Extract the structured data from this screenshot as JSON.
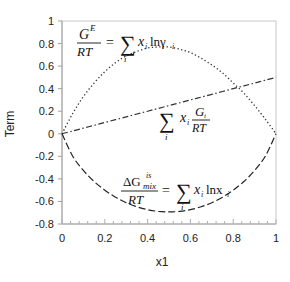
{
  "chart_data": {
    "type": "line",
    "title": "",
    "xlabel": "x1",
    "ylabel": "Term",
    "xlim": [
      0,
      1
    ],
    "ylim": [
      -0.8,
      1
    ],
    "x_ticks": [
      "0",
      "0.2",
      "0.4",
      "0.6",
      "0.8",
      "1"
    ],
    "y_ticks": [
      "1",
      "0.8",
      "0.6",
      "0.4",
      "0.2",
      "0",
      "-0.2",
      "-0.4",
      "-0.6",
      "-0.8"
    ],
    "grid": false,
    "legend": "none (inline equation annotations)",
    "x": [
      0,
      0.05,
      0.1,
      0.15,
      0.2,
      0.25,
      0.3,
      0.35,
      0.4,
      0.45,
      0.5,
      0.55,
      0.6,
      0.65,
      0.7,
      0.75,
      0.8,
      0.85,
      0.9,
      0.95,
      1
    ],
    "series": [
      {
        "name": "G^E/RT = Σ x_i ln γ_i",
        "style": "dotted",
        "values": [
          0,
          0.18,
          0.33,
          0.45,
          0.55,
          0.63,
          0.69,
          0.73,
          0.76,
          0.77,
          0.77,
          0.75,
          0.72,
          0.67,
          0.61,
          0.54,
          0.45,
          0.36,
          0.25,
          0.13,
          0
        ]
      },
      {
        "name": "Σ x_i G_i/RT",
        "style": "dash-dot",
        "values": [
          0,
          0.025,
          0.05,
          0.075,
          0.1,
          0.125,
          0.15,
          0.175,
          0.2,
          0.225,
          0.25,
          0.275,
          0.3,
          0.325,
          0.35,
          0.375,
          0.4,
          0.425,
          0.45,
          0.475,
          0.5
        ]
      },
      {
        "name": "ΔG_mix^is/RT = Σ x_i ln x_i",
        "style": "dashed-solid",
        "values": [
          0,
          -0.199,
          -0.325,
          -0.423,
          -0.5,
          -0.562,
          -0.611,
          -0.647,
          -0.673,
          -0.688,
          -0.693,
          -0.688,
          -0.673,
          -0.647,
          -0.611,
          -0.562,
          -0.5,
          -0.423,
          -0.325,
          -0.199,
          0
        ]
      }
    ],
    "annotations": [
      "G^E/RT = Σ_i x_i ln γ_i",
      "Σ_i x_i G_i/RT",
      "ΔG_mix^is/RT = Σ_i x_i ln x_i"
    ]
  },
  "labels": {
    "xlabel": "x1",
    "ylabel": "Term",
    "eq1": {
      "num": "G",
      "sup": "E",
      "den": "RT",
      "eq": "=",
      "sum": "∑",
      "sub": "i",
      "x": "x",
      "xi": "i",
      "ln": "lnγ",
      "lnsub": "i"
    },
    "eq2": {
      "sum": "∑",
      "sub": "i",
      "x": "x",
      "xi": "i",
      "num": "G",
      "numsub": "i",
      "den": "RT"
    },
    "eq3": {
      "delta": "ΔG",
      "sup": "is",
      "subm": "mix",
      "den": "RT",
      "eq": "=",
      "sum": "∑",
      "sub": "i",
      "x": "x",
      "xi": "i",
      "ln": "lnx",
      "lnsub": "i"
    }
  }
}
